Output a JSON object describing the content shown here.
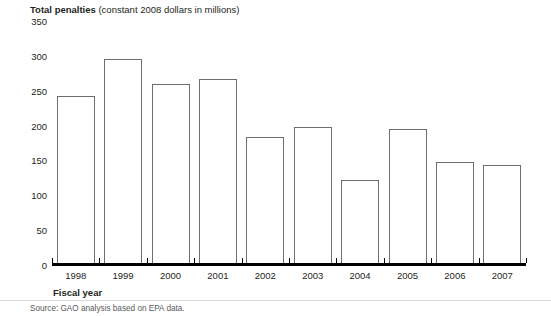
{
  "figure": {
    "title_main": "Total penalties",
    "title_sub": "(constant 2008 dollars in millions)",
    "source": "Source: GAO analysis based on EPA data.",
    "axis_title": "Fiscal year"
  },
  "chart_data": {
    "type": "bar",
    "title": "Total penalties (constant 2008 dollars in millions)",
    "xlabel": "Fiscal year",
    "ylabel": "",
    "categories": [
      "1998",
      "1999",
      "2000",
      "2001",
      "2002",
      "2003",
      "2004",
      "2005",
      "2006",
      "2007"
    ],
    "values": [
      241,
      294,
      258,
      266,
      182,
      196,
      120,
      194,
      146,
      142
    ],
    "ylim": [
      0,
      350
    ],
    "yticks": [
      0,
      50,
      100,
      150,
      200,
      250,
      300,
      350
    ],
    "ytick_labels": [
      "0",
      "50",
      "100",
      "150",
      "200",
      "250",
      "300",
      "350"
    ],
    "grid": false,
    "legend": "none",
    "bar_fill": "#ffffff",
    "bar_edge": "#6d6e71",
    "axis_color": "#000000"
  }
}
